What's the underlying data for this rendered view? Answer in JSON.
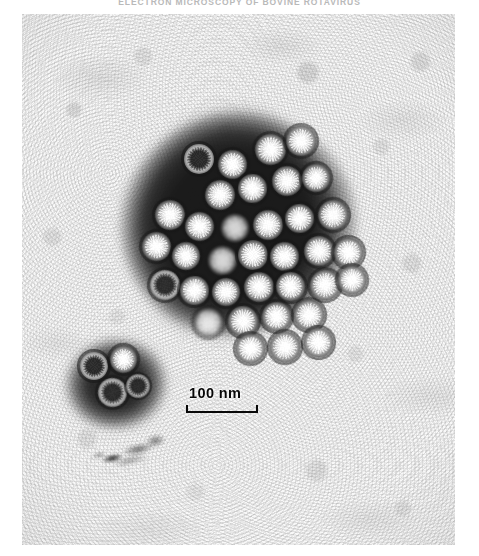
{
  "page": {
    "running_head": "ELECTRON MICROSCOPY OF BOVINE ROTAVIRUS",
    "background_color": "#ffffff"
  },
  "figure": {
    "name": "electron-micrograph",
    "technique": "negative-stain transmission electron microscopy",
    "plate": {
      "left": 22,
      "top": 14,
      "width": 433,
      "height": 531,
      "film_base_color": "#f2f2f2",
      "stain_color": "#000000",
      "particle_color": "#f5f5f5"
    },
    "scale_bar": {
      "label": "100 nm",
      "value": 100,
      "unit": "nm",
      "bar_length_px": 72,
      "tick_style": "upward end ticks",
      "color": "#0d0d0d"
    },
    "features": [
      {
        "name": "large-virus-cluster",
        "particle_count": 35,
        "description": "dense aggregate of wheel-shaped virions embedded in dark stain"
      },
      {
        "name": "small-virus-cluster",
        "particle_count": 4,
        "description": "small aggregate of empty ring-like capsids"
      },
      {
        "name": "debris-fragment",
        "description": "dark elongated membranous debris below the small cluster"
      }
    ],
    "particles": {
      "large_cluster": [
        {
          "x": 162,
          "y": 130,
          "d": 30,
          "type": "ring"
        },
        {
          "x": 196,
          "y": 136,
          "d": 29,
          "type": "full"
        },
        {
          "x": 233,
          "y": 120,
          "d": 31,
          "type": "full"
        },
        {
          "x": 264,
          "y": 112,
          "d": 30,
          "type": "full"
        },
        {
          "x": 183,
          "y": 166,
          "d": 30,
          "type": "full"
        },
        {
          "x": 216,
          "y": 160,
          "d": 29,
          "type": "full"
        },
        {
          "x": 250,
          "y": 152,
          "d": 30,
          "type": "full"
        },
        {
          "x": 280,
          "y": 150,
          "d": 28,
          "type": "full"
        },
        {
          "x": 133,
          "y": 186,
          "d": 30,
          "type": "full"
        },
        {
          "x": 163,
          "y": 198,
          "d": 29,
          "type": "full"
        },
        {
          "x": 199,
          "y": 200,
          "d": 28,
          "type": "dim"
        },
        {
          "x": 231,
          "y": 196,
          "d": 30,
          "type": "full"
        },
        {
          "x": 263,
          "y": 190,
          "d": 29,
          "type": "full"
        },
        {
          "x": 296,
          "y": 186,
          "d": 30,
          "type": "full"
        },
        {
          "x": 120,
          "y": 218,
          "d": 29,
          "type": "full"
        },
        {
          "x": 150,
          "y": 228,
          "d": 28,
          "type": "full"
        },
        {
          "x": 186,
          "y": 232,
          "d": 29,
          "type": "dim"
        },
        {
          "x": 216,
          "y": 226,
          "d": 30,
          "type": "full"
        },
        {
          "x": 248,
          "y": 228,
          "d": 29,
          "type": "full"
        },
        {
          "x": 282,
          "y": 222,
          "d": 30,
          "type": "full"
        },
        {
          "x": 312,
          "y": 224,
          "d": 29,
          "type": "full"
        },
        {
          "x": 128,
          "y": 256,
          "d": 30,
          "type": "ring"
        },
        {
          "x": 158,
          "y": 262,
          "d": 29,
          "type": "full"
        },
        {
          "x": 190,
          "y": 264,
          "d": 28,
          "type": "full"
        },
        {
          "x": 222,
          "y": 258,
          "d": 30,
          "type": "full"
        },
        {
          "x": 254,
          "y": 258,
          "d": 29,
          "type": "full"
        },
        {
          "x": 288,
          "y": 256,
          "d": 30,
          "type": "full"
        },
        {
          "x": 316,
          "y": 252,
          "d": 28,
          "type": "full"
        },
        {
          "x": 172,
          "y": 294,
          "d": 29,
          "type": "dim"
        },
        {
          "x": 206,
          "y": 292,
          "d": 30,
          "type": "full"
        },
        {
          "x": 240,
          "y": 288,
          "d": 29,
          "type": "full"
        },
        {
          "x": 272,
          "y": 286,
          "d": 30,
          "type": "full"
        },
        {
          "x": 214,
          "y": 320,
          "d": 29,
          "type": "full"
        },
        {
          "x": 248,
          "y": 318,
          "d": 30,
          "type": "full"
        },
        {
          "x": 282,
          "y": 314,
          "d": 29,
          "type": "full"
        }
      ],
      "small_cluster": [
        {
          "x": 58,
          "y": 338,
          "d": 28,
          "type": "ring"
        },
        {
          "x": 88,
          "y": 332,
          "d": 27,
          "type": "full"
        },
        {
          "x": 76,
          "y": 364,
          "d": 29,
          "type": "ring"
        },
        {
          "x": 104,
          "y": 360,
          "d": 24,
          "type": "ring"
        }
      ]
    }
  }
}
